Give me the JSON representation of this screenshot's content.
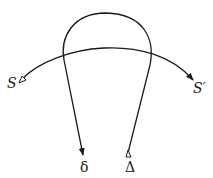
{
  "diagram": {
    "labels": {
      "source": "S",
      "target": "S′",
      "left_end": "δ",
      "right_end": "Δ"
    },
    "colors": {
      "stroke": "#1a1a1a",
      "background": "#ffffff"
    }
  }
}
